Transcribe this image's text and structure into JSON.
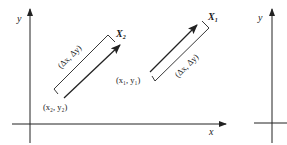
{
  "diagram": {
    "left_panel": {
      "x_axis_label": "x",
      "y_axis_label": "y",
      "vector_2": {
        "point_label": "X",
        "point_subscript": "2",
        "start_label": "(x₂, y₂)",
        "delta_label": "(Δx, Δy)"
      },
      "vector_1": {
        "point_label": "X",
        "point_subscript": "1",
        "start_label": "(x₁, y₁)",
        "delta_label": "(Δx, Δy)"
      }
    },
    "right_panel": {
      "y_axis_label": "y"
    },
    "colors": {
      "line": "#222222",
      "background": "#ffffff"
    }
  }
}
